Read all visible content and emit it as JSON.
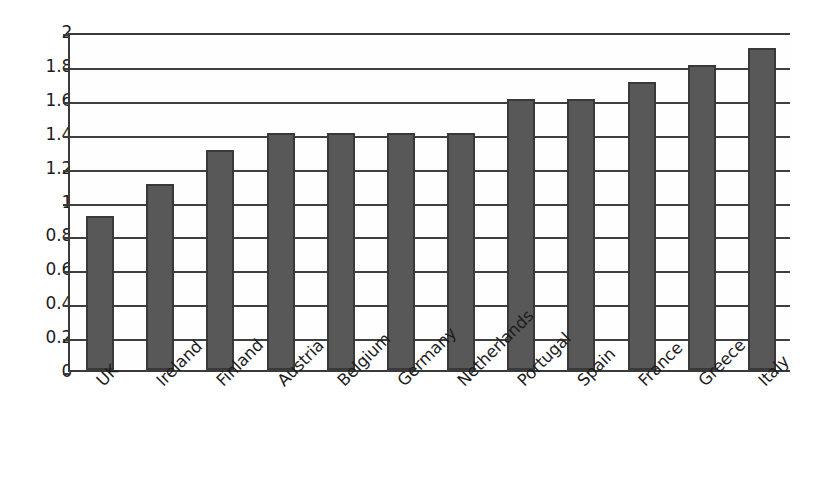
{
  "chart_data": {
    "type": "bar",
    "title": "",
    "subtitle": "",
    "xlabel": "",
    "ylabel": "",
    "categories": [
      "UK",
      "Ireland",
      "Finland",
      "Austria",
      "Belgium",
      "Germany",
      "Netherlands",
      "Portugal",
      "Spain",
      "France",
      "Greece",
      "Italy"
    ],
    "values": [
      0.91,
      1.1,
      1.3,
      1.4,
      1.4,
      1.4,
      1.4,
      1.6,
      1.6,
      1.7,
      1.8,
      1.9
    ],
    "ylim": [
      0,
      2
    ],
    "ytick_labels": [
      "0",
      "0.2",
      "0.4",
      "0.6",
      "0.8",
      "1",
      "1.2",
      "1.4",
      "1.6",
      "1.8",
      "2"
    ],
    "ytick_values": [
      0,
      0.2,
      0.4,
      0.6,
      0.8,
      1,
      1.2,
      1.4,
      1.6,
      1.8,
      2
    ],
    "grid": true,
    "grid_axis": "y",
    "legend": false,
    "legend_position": "none",
    "xtick_rotation": -45,
    "bar_color": "#585858",
    "bar_edge_color": "#393939",
    "grid_color": "#3f3f3f",
    "axis_color": "#3a3a3a",
    "background_color": "#ffffff"
  }
}
